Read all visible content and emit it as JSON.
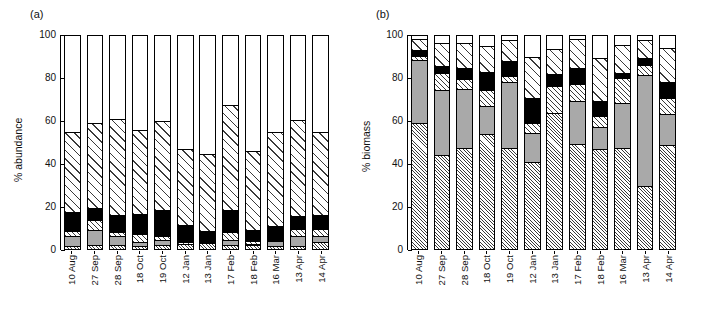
{
  "figure": {
    "panels": [
      {
        "tag": "(a)",
        "ylabel": "% abundance"
      },
      {
        "tag": "(b)",
        "ylabel": "% biomass"
      }
    ]
  },
  "chart_data": [
    {
      "type": "bar",
      "subtype": "stacked-100",
      "panel": "(a)",
      "title": "",
      "xlabel": "",
      "ylabel": "% abundance",
      "ylim": [
        0,
        100
      ],
      "yticks": [
        0,
        20,
        40,
        60,
        80,
        100
      ],
      "grid": false,
      "legend": "none",
      "categories": [
        "10 Aug",
        "27 Sep",
        "28 Sep",
        "18 Oct",
        "19 Oct",
        "12 Jan",
        "13 Jan",
        "17 Feb",
        "18 Feb",
        "16 Mar",
        "13 Apr",
        "14 Apr"
      ],
      "series": [
        {
          "name": "fine-hatch",
          "pattern": "p-finehatch",
          "values": [
            1.0,
            1.5,
            1.5,
            1.0,
            1.5,
            2.0,
            2.5,
            1.5,
            1.5,
            1.0,
            1.0,
            3.0
          ]
        },
        {
          "name": "gray",
          "pattern": "p-gray",
          "values": [
            4.5,
            7.0,
            4.0,
            2.0,
            2.5,
            0.0,
            0.0,
            2.5,
            0.5,
            2.5,
            4.5,
            2.5
          ]
        },
        {
          "name": "hatch",
          "pattern": "p-hatch",
          "values": [
            2.5,
            4.5,
            2.0,
            3.5,
            1.5,
            1.0,
            0.5,
            3.5,
            1.5,
            0.5,
            3.5,
            3.5
          ]
        },
        {
          "name": "black",
          "pattern": "p-black",
          "values": [
            9.0,
            6.0,
            8.0,
            9.5,
            12.5,
            8.0,
            5.0,
            10.5,
            5.0,
            6.5,
            6.0,
            6.5
          ]
        },
        {
          "name": "coarse-hatch",
          "pattern": "p-coarsehatch",
          "values": [
            37.5,
            39.5,
            45.0,
            39.5,
            41.5,
            35.5,
            36.0,
            49.0,
            37.0,
            44.0,
            45.0,
            39.0
          ]
        },
        {
          "name": "white",
          "pattern": "p-white",
          "values": [
            45.5,
            41.5,
            39.5,
            44.5,
            40.5,
            53.5,
            56.0,
            33.0,
            54.5,
            45.5,
            40.0,
            45.5
          ]
        }
      ]
    },
    {
      "type": "bar",
      "subtype": "stacked-100",
      "panel": "(b)",
      "title": "",
      "xlabel": "",
      "ylabel": "% biomass",
      "ylim": [
        0,
        100
      ],
      "yticks": [
        0,
        20,
        40,
        60,
        80,
        100
      ],
      "grid": false,
      "legend": "none",
      "categories": [
        "10 Aug",
        "27 Sep",
        "28 Sep",
        "18 Oct",
        "19 Oct",
        "12 Jan",
        "13 Jan",
        "17 Feb",
        "18 Feb",
        "16 Mar",
        "13 Apr",
        "14 Apr"
      ],
      "series": [
        {
          "name": "fine-hatch",
          "pattern": "p-finehatch",
          "values": [
            58.5,
            43.5,
            47.0,
            53.5,
            47.0,
            40.5,
            63.5,
            49.0,
            46.5,
            47.0,
            29.0,
            48.5
          ]
        },
        {
          "name": "gray",
          "pattern": "p-gray",
          "values": [
            30.0,
            30.5,
            27.5,
            13.0,
            31.0,
            13.5,
            0.0,
            20.0,
            10.5,
            21.0,
            52.0,
            14.5
          ]
        },
        {
          "name": "hatch",
          "pattern": "p-hatch",
          "values": [
            1.5,
            8.0,
            5.0,
            7.5,
            3.0,
            4.5,
            12.5,
            8.0,
            5.0,
            12.0,
            5.0,
            7.5
          ]
        },
        {
          "name": "black",
          "pattern": "p-black",
          "values": [
            3.0,
            3.5,
            5.0,
            8.5,
            7.0,
            12.0,
            5.5,
            7.5,
            7.0,
            2.0,
            3.0,
            7.5
          ]
        },
        {
          "name": "coarse-hatch",
          "pattern": "p-coarsehatch",
          "values": [
            5.0,
            11.0,
            12.0,
            12.5,
            9.5,
            19.0,
            12.0,
            13.5,
            20.0,
            13.5,
            8.5,
            16.0
          ]
        },
        {
          "name": "white",
          "pattern": "p-white",
          "values": [
            2.0,
            3.5,
            3.5,
            5.0,
            2.5,
            10.5,
            6.5,
            2.0,
            11.0,
            4.5,
            2.5,
            6.0
          ]
        }
      ]
    }
  ]
}
